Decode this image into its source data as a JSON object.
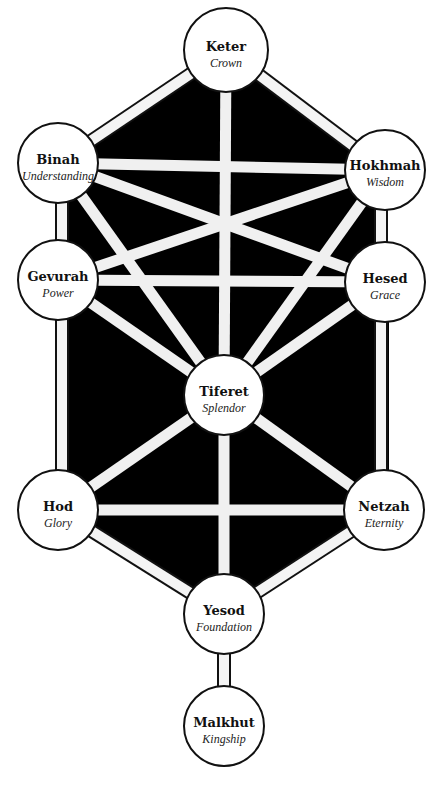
{
  "diagram": {
    "colors": {
      "fill": "#000000",
      "path": "#f4f4f4",
      "node": "#ffffff",
      "stroke": "#111111"
    },
    "nodes": [
      {
        "id": "keter",
        "name": "Keter",
        "meaning": "Crown",
        "x": 226,
        "y": 50
      },
      {
        "id": "binah",
        "name": "Binah",
        "meaning": "Understanding",
        "x": 58,
        "y": 163
      },
      {
        "id": "hokhmah",
        "name": "Hokhmah",
        "meaning": "Wisdom",
        "x": 385,
        "y": 170
      },
      {
        "id": "gevurah",
        "name": "Gevurah",
        "meaning": "Power",
        "x": 58,
        "y": 280
      },
      {
        "id": "hesed",
        "name": "Hesed",
        "meaning": "Grace",
        "x": 385,
        "y": 282
      },
      {
        "id": "tiferet",
        "name": "Tiferet",
        "meaning": "Splendor",
        "x": 224,
        "y": 395
      },
      {
        "id": "hod",
        "name": "Hod",
        "meaning": "Glory",
        "x": 58,
        "y": 510
      },
      {
        "id": "netzah",
        "name": "Netzah",
        "meaning": "Eternity",
        "x": 384,
        "y": 510
      },
      {
        "id": "yesod",
        "name": "Yesod",
        "meaning": "Foundation",
        "x": 224,
        "y": 614
      },
      {
        "id": "malkhut",
        "name": "Malkhut",
        "meaning": "Kingship",
        "x": 224,
        "y": 726
      }
    ],
    "paths": [
      [
        "keter",
        "binah"
      ],
      [
        "keter",
        "hokhmah"
      ],
      [
        "keter",
        "tiferet"
      ],
      [
        "binah",
        "hokhmah"
      ],
      [
        "binah",
        "gevurah"
      ],
      [
        "binah",
        "tiferet"
      ],
      [
        "binah",
        "hesed"
      ],
      [
        "hokhmah",
        "hesed"
      ],
      [
        "hokhmah",
        "tiferet"
      ],
      [
        "hokhmah",
        "gevurah"
      ],
      [
        "gevurah",
        "hesed"
      ],
      [
        "gevurah",
        "tiferet"
      ],
      [
        "gevurah",
        "hod"
      ],
      [
        "hesed",
        "tiferet"
      ],
      [
        "hesed",
        "netzah"
      ],
      [
        "tiferet",
        "hod"
      ],
      [
        "tiferet",
        "netzah"
      ],
      [
        "tiferet",
        "yesod"
      ],
      [
        "hod",
        "netzah"
      ],
      [
        "hod",
        "yesod"
      ],
      [
        "netzah",
        "yesod"
      ],
      [
        "yesod",
        "malkhut"
      ]
    ]
  }
}
